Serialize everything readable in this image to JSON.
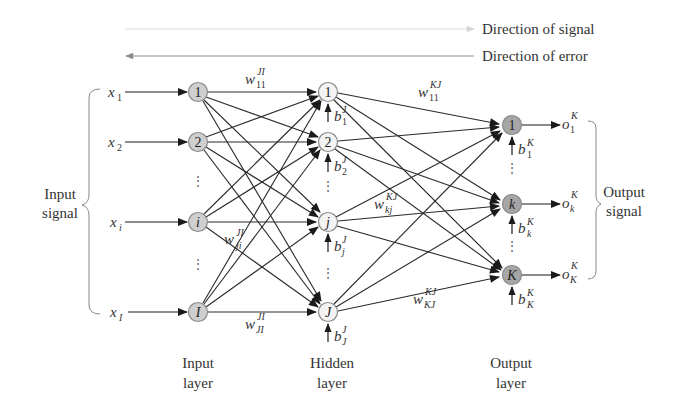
{
  "legend": {
    "signal": "Direction of signal",
    "error": "Direction of error"
  },
  "inputs": [
    {
      "var": "x",
      "sub": "1",
      "node": "1"
    },
    {
      "var": "x",
      "sub": "2",
      "node": "2"
    },
    {
      "var": "x",
      "sub": "i",
      "node": "i"
    },
    {
      "var": "x",
      "sub": "I",
      "node": "I"
    }
  ],
  "hidden": [
    {
      "node": "1",
      "bias": "b",
      "bias_sup": "J",
      "bias_sub": "1"
    },
    {
      "node": "2",
      "bias": "b",
      "bias_sup": "J",
      "bias_sub": "2"
    },
    {
      "node": "j",
      "bias": "b",
      "bias_sup": "J",
      "bias_sub": "j"
    },
    {
      "node": "J",
      "bias": "b",
      "bias_sup": "J",
      "bias_sub": "J"
    }
  ],
  "outputs": [
    {
      "node": "1",
      "bias": "b",
      "bias_sup": "K",
      "bias_sub": "1",
      "out": "o",
      "out_sup": "K",
      "out_sub": "1"
    },
    {
      "node": "k",
      "bias": "b",
      "bias_sup": "K",
      "bias_sub": "k",
      "out": "o",
      "out_sup": "K",
      "out_sub": "k"
    },
    {
      "node": "K",
      "bias": "b",
      "bias_sup": "K",
      "bias_sub": "K",
      "out": "o",
      "out_sup": "K",
      "out_sub": "K"
    }
  ],
  "weights": {
    "w11_JI": {
      "base": "w",
      "sup": "JI",
      "sub": "11"
    },
    "wji_JI": {
      "base": "w",
      "sup": "JI",
      "sub": "ji"
    },
    "wJI_JI": {
      "base": "w",
      "sup": "JI",
      "sub": "JI"
    },
    "w11_KJ": {
      "base": "w",
      "sup": "KJ",
      "sub": "11"
    },
    "wkj_KJ": {
      "base": "w",
      "sup": "KJ",
      "sub": "kj"
    },
    "wKJ_KJ": {
      "base": "w",
      "sup": "KJ",
      "sub": "KJ"
    }
  },
  "side_labels": {
    "input_signal_1": "Input",
    "input_signal_2": "signal",
    "output_signal_1": "Output",
    "output_signal_2": "signal"
  },
  "layer_labels": {
    "input_1": "Input",
    "input_2": "layer",
    "hidden_1": "Hidden",
    "hidden_2": "layer",
    "output_1": "Output",
    "output_2": "layer"
  },
  "ellipsis": "⋮",
  "colors": {
    "input_node": "#cfcfcf",
    "hidden_node": "#f3f3f3",
    "output_node": "#a6a6a6",
    "signal_arrow": "#d6d6d6",
    "error_arrow": "#8c8c8c"
  }
}
